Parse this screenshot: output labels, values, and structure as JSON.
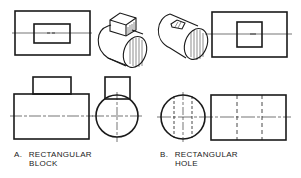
{
  "figure": {
    "panels": [
      {
        "id": "A",
        "label_prefix": "A.",
        "label_line1": "RECTANGULAR",
        "label_line2": "BLOCK",
        "views": [
          "top-view",
          "isometric-cylinder-with-block",
          "front-view",
          "side-view"
        ]
      },
      {
        "id": "B",
        "label_prefix": "B.",
        "label_line1": "RECTANGULAR",
        "label_line2": "HOLE",
        "views": [
          "isometric-cylinder-with-hole",
          "top-view",
          "side-view",
          "front-view"
        ]
      }
    ],
    "colors": {
      "line": "#1a1a1a",
      "background": "#ffffff"
    }
  }
}
